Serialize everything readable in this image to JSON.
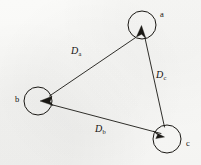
{
  "figure": {
    "width": 201,
    "height": 165,
    "background_color": "#f7f7f5",
    "ink_color": "#1a1814"
  },
  "nodes": [
    {
      "id": "a",
      "label": "a",
      "cx": 142,
      "cy": 25,
      "r": 14,
      "label_x": 160,
      "label_y": 14
    },
    {
      "id": "b",
      "label": "b",
      "cx": 38,
      "cy": 101,
      "r": 14,
      "label_x": 16,
      "label_y": 97
    },
    {
      "id": "c",
      "label": "c",
      "cx": 167,
      "cy": 139,
      "r": 14,
      "label_x": 186,
      "label_y": 142
    }
  ],
  "edges": [
    {
      "id": "Da",
      "label_base": "D",
      "label_sub": "a",
      "from": "a",
      "to": "b",
      "label_x": 72,
      "label_y": 47,
      "arrowhead_at": "b"
    },
    {
      "id": "Db",
      "label_base": "D",
      "label_sub": "b",
      "from": "b",
      "to": "c",
      "label_x": 96,
      "label_y": 125,
      "arrowhead_at": "c"
    },
    {
      "id": "Dc",
      "label_base": "D",
      "label_sub": "c",
      "from": "c",
      "to": "a",
      "label_x": 157,
      "label_y": 71,
      "arrowhead_at": "a"
    }
  ]
}
